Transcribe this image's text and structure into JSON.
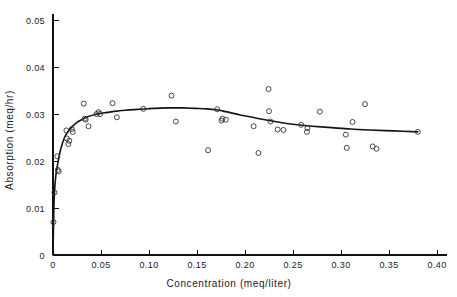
{
  "chart_data": {
    "type": "scatter",
    "title": "",
    "xlabel": "Concentration (meq/liter)",
    "ylabel": "Absorption (meq/hr)",
    "xlim": [
      0,
      0.42
    ],
    "ylim": [
      0,
      0.053
    ],
    "xticks": [
      0,
      0.05,
      0.1,
      0.15,
      0.2,
      0.25,
      0.3,
      0.35,
      0.4
    ],
    "xtick_labels": [
      "0",
      "0.05",
      "0.10",
      "0.15",
      "0.20",
      "0.25",
      "0.30",
      "0.35",
      "0.40"
    ],
    "yticks": [
      0,
      0.01,
      0.02,
      0.03,
      0.04,
      0.05
    ],
    "ytick_labels": [
      "0",
      "0.01",
      "0.02",
      "0.03",
      "0.04",
      "0.05"
    ],
    "grid": false,
    "legend": false,
    "marker": "open-circle",
    "series": [
      {
        "name": "observations",
        "kind": "scatter",
        "points": [
          [
            0.0005,
            0.007
          ],
          [
            0.0015,
            0.0133
          ],
          [
            0.0045,
            0.021
          ],
          [
            0.005,
            0.0181
          ],
          [
            0.006,
            0.0178
          ],
          [
            0.014,
            0.0265
          ],
          [
            0.0145,
            0.0248
          ],
          [
            0.016,
            0.0236
          ],
          [
            0.017,
            0.0243
          ],
          [
            0.0195,
            0.0268
          ],
          [
            0.0205,
            0.0262
          ],
          [
            0.032,
            0.0322
          ],
          [
            0.033,
            0.029
          ],
          [
            0.034,
            0.0288
          ],
          [
            0.037,
            0.0274
          ],
          [
            0.0455,
            0.03
          ],
          [
            0.0475,
            0.0304
          ],
          [
            0.049,
            0.03
          ],
          [
            0.062,
            0.0323
          ],
          [
            0.0665,
            0.0293
          ],
          [
            0.094,
            0.0311
          ],
          [
            0.1235,
            0.0339
          ],
          [
            0.128,
            0.0284
          ],
          [
            0.1615,
            0.0223
          ],
          [
            0.171,
            0.031
          ],
          [
            0.1755,
            0.0286
          ],
          [
            0.1765,
            0.029
          ],
          [
            0.18,
            0.0288
          ],
          [
            0.209,
            0.0274
          ],
          [
            0.214,
            0.0217
          ],
          [
            0.2245,
            0.0353
          ],
          [
            0.225,
            0.0306
          ],
          [
            0.2265,
            0.0284
          ],
          [
            0.234,
            0.0267
          ],
          [
            0.24,
            0.0266
          ],
          [
            0.2585,
            0.0277
          ],
          [
            0.2645,
            0.0262
          ],
          [
            0.265,
            0.027
          ],
          [
            0.278,
            0.0305
          ],
          [
            0.305,
            0.0256
          ],
          [
            0.306,
            0.0228
          ],
          [
            0.312,
            0.0283
          ],
          [
            0.325,
            0.0321
          ],
          [
            0.333,
            0.0231
          ],
          [
            0.337,
            0.0226
          ],
          [
            0.38,
            0.0262
          ]
        ]
      },
      {
        "name": "fitted-curve",
        "kind": "line",
        "points": [
          [
            0.0,
            0.0
          ],
          [
            0.0008,
            0.009
          ],
          [
            0.0016,
            0.0135
          ],
          [
            0.003,
            0.017
          ],
          [
            0.005,
            0.0195
          ],
          [
            0.008,
            0.0225
          ],
          [
            0.012,
            0.025
          ],
          [
            0.016,
            0.0264
          ],
          [
            0.02,
            0.0273
          ],
          [
            0.025,
            0.0282
          ],
          [
            0.03,
            0.0288
          ],
          [
            0.036,
            0.0294
          ],
          [
            0.044,
            0.0299
          ],
          [
            0.052,
            0.0302
          ],
          [
            0.062,
            0.0305
          ],
          [
            0.075,
            0.0308
          ],
          [
            0.09,
            0.031
          ],
          [
            0.105,
            0.0312
          ],
          [
            0.12,
            0.0313
          ],
          [
            0.135,
            0.0313
          ],
          [
            0.148,
            0.0312
          ],
          [
            0.16,
            0.0311
          ],
          [
            0.17,
            0.0309
          ],
          [
            0.18,
            0.0305
          ],
          [
            0.195,
            0.0298
          ],
          [
            0.21,
            0.0292
          ],
          [
            0.225,
            0.0286
          ],
          [
            0.24,
            0.0281
          ],
          [
            0.255,
            0.0277
          ],
          [
            0.27,
            0.0274
          ],
          [
            0.29,
            0.0271
          ],
          [
            0.31,
            0.0268
          ],
          [
            0.33,
            0.0266
          ],
          [
            0.355,
            0.0264
          ],
          [
            0.38,
            0.0262
          ]
        ]
      }
    ]
  },
  "axes": {
    "x_title": "Concentration (meq/liter)",
    "y_title": "Absorption (meq/hr)"
  }
}
